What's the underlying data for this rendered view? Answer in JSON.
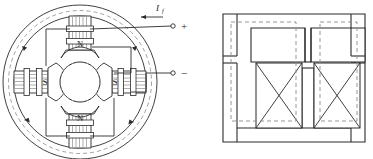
{
  "figure": {
    "type": "engineering-diagram",
    "stroke_color": "#2b2b2b",
    "flux_color": "#8a8a8a",
    "fill_color": "#ffffff"
  },
  "left_diagram": {
    "name": "four-pole-machine-cross-section",
    "current_label": "I",
    "current_subscript": "f",
    "current_direction": "leftward",
    "terminals": [
      {
        "id": "positive",
        "label": "+",
        "x": 182,
        "y": 26
      },
      {
        "id": "negative",
        "label": "−",
        "x": 182,
        "y": 73
      }
    ],
    "poles": [
      {
        "position": "top",
        "label": "N",
        "x": 80,
        "y": 45
      },
      {
        "position": "bottom",
        "label": "N",
        "x": 80,
        "y": 120
      },
      {
        "position": "left",
        "label": "S",
        "x": 45,
        "y": 83
      },
      {
        "position": "right",
        "label": "S",
        "x": 115,
        "y": 83
      }
    ],
    "rotor": {
      "center_x": 80,
      "center_y": 82,
      "radius": 20
    },
    "stator": {
      "outer_radius": 77,
      "yoke_radius": 66,
      "flux_radius": 71
    },
    "flux_arrow_count": 4
  },
  "right_diagram": {
    "name": "equivalent-magnetic-core",
    "coils": [
      {
        "id": "coil-left",
        "label": "",
        "x": 258,
        "y": 63,
        "w": 44,
        "h": 57
      },
      {
        "id": "coil-right",
        "label": "",
        "x": 313,
        "y": 63,
        "w": 44,
        "h": 57
      }
    ],
    "core": {
      "x": 223,
      "y": 14,
      "w": 142,
      "h": 128
    },
    "flux_loops": 2
  }
}
